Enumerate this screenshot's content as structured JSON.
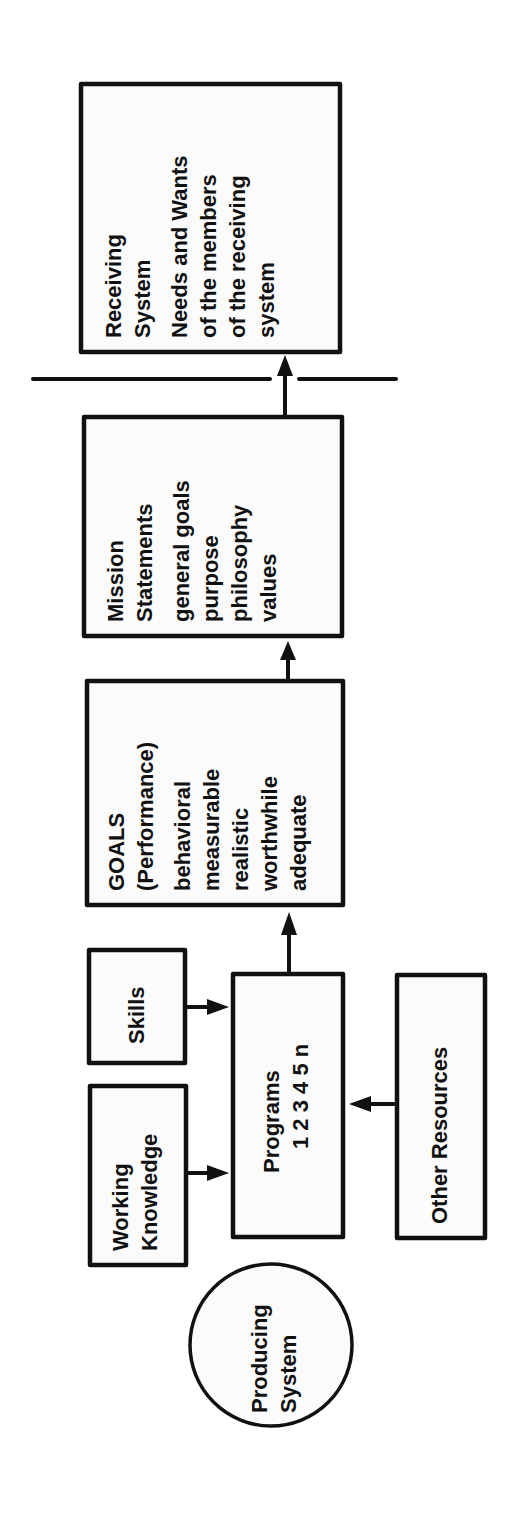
{
  "diagram": {
    "orientation": "rotated-90-ccw",
    "ink_color": "#111111",
    "background_color": "#ffffff",
    "nodes": {
      "producing_system": {
        "lines": [
          "Producing",
          "System"
        ]
      },
      "working_knowledge": {
        "lines": [
          "Working",
          "Knowledge"
        ]
      },
      "skills": {
        "lines": [
          "Skills"
        ]
      },
      "programs": {
        "lines": [
          "Programs",
          "1 2 3 4 5 n"
        ]
      },
      "other_resources": {
        "lines": [
          "Other Resources"
        ]
      },
      "goals": {
        "lines": [
          "GOALS",
          "(Performance)",
          "behavioral",
          "measurable",
          "realistic",
          "worthwhile",
          "adequate"
        ]
      },
      "mission_statements": {
        "lines": [
          "Mission",
          "Statements",
          "general goals",
          "purpose",
          "philosophy",
          "values"
        ]
      },
      "receiving_system": {
        "lines": [
          "Receiving",
          "System",
          "Needs and Wants",
          "of the members",
          "of the receiving",
          "system"
        ]
      }
    },
    "edges": [
      {
        "from": "working_knowledge",
        "to": "programs"
      },
      {
        "from": "skills",
        "to": "programs"
      },
      {
        "from": "other_resources",
        "to": "programs"
      },
      {
        "from": "programs",
        "to": "goals"
      },
      {
        "from": "goals",
        "to": "mission_statements"
      },
      {
        "from": "mission_statements",
        "to": "receiving_system",
        "crosses": "system-boundary"
      }
    ],
    "boundary": {
      "label": "system-boundary"
    }
  }
}
